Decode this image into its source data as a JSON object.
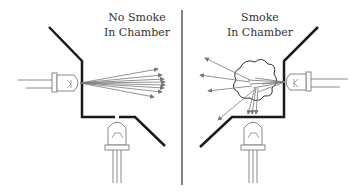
{
  "panels": [
    {
      "title_line1": "No Smoke",
      "title_line2": "In Chamber",
      "state": "clear"
    },
    {
      "title_line1": "Smoke",
      "title_line2": "In Chamber",
      "state": "smoke"
    }
  ],
  "colors": {
    "wall": "#1a1a1a",
    "ray": "#777777",
    "component": "#888888",
    "divider": "#333333"
  }
}
